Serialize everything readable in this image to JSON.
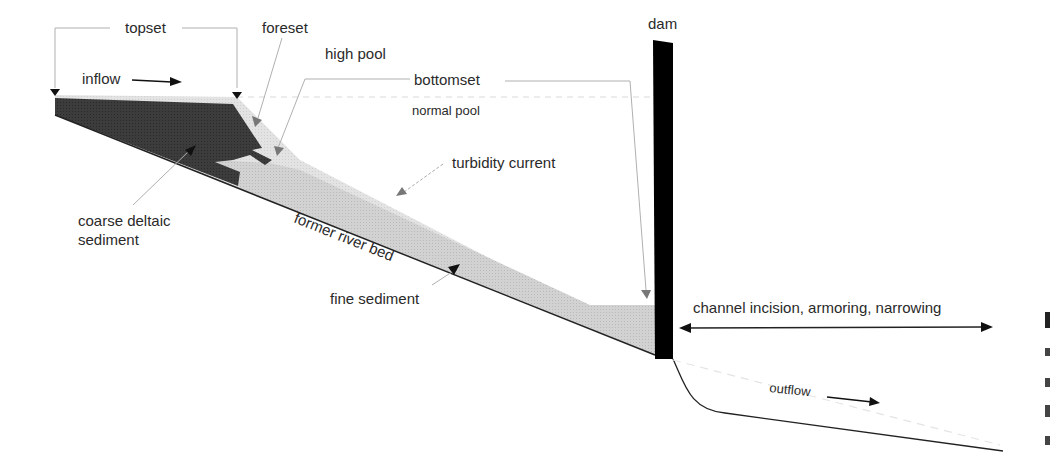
{
  "figure": {
    "labels": {
      "topset": "topset",
      "foreset": "foreset",
      "high_pool": "high pool",
      "bottomset": "bottomset",
      "normal_pool": "normal pool",
      "inflow": "inflow",
      "dam": "dam",
      "turbidity_current": "turbidity current",
      "coarse_sediment_line1": "coarse deltaic",
      "coarse_sediment_line2": "sediment",
      "former_river_bed": "former river bed",
      "fine_sediment": "fine sediment",
      "channel_effects": "channel incision, armoring, narrowing",
      "outflow": "outflow"
    },
    "colors": {
      "coarse_sediment": "#3a3a3a",
      "fine_sediment": "#c4c4c4",
      "topset_layer": "#dcdcdc",
      "dam": "#000000",
      "leader_line": "#b0b0b0",
      "pointer": "#7a7a7a"
    }
  }
}
